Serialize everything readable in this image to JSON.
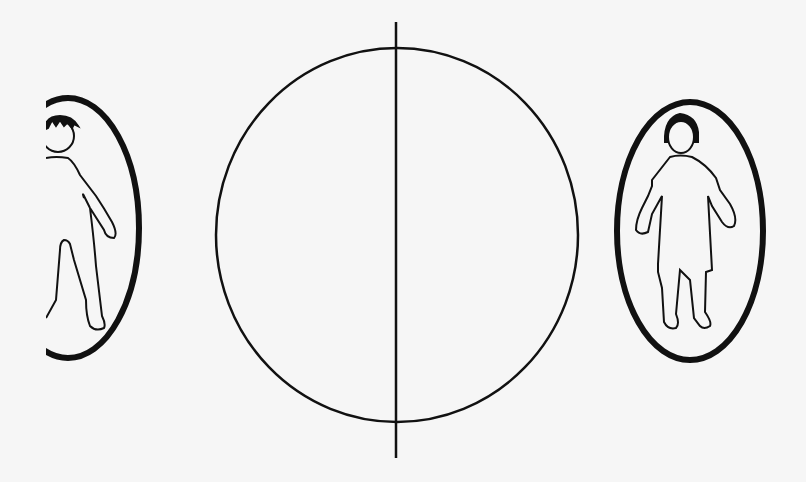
{
  "diagram": {
    "background": "#f6f6f6",
    "stroke_color": "#111111",
    "center_circle": {
      "cx": 397,
      "cy": 235,
      "rx": 181,
      "ry": 187
    },
    "divider_line": {
      "x": 396,
      "y1": 22,
      "y2": 458
    },
    "left_figure": {
      "label": "male-figure",
      "ellipse": {
        "cx": 68,
        "cy": 228,
        "rx": 72,
        "ry": 130
      }
    },
    "right_figure": {
      "label": "female-figure",
      "ellipse": {
        "cx": 690,
        "cy": 231,
        "rx": 74,
        "ry": 130
      }
    }
  }
}
